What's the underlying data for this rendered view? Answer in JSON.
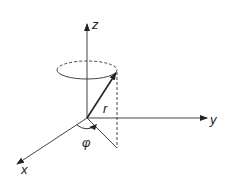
{
  "diagram": {
    "type": "3d-coordinate-system",
    "axes": {
      "x": {
        "label": "x"
      },
      "y": {
        "label": "y"
      },
      "z": {
        "label": "z"
      }
    },
    "vector": {
      "label": "r"
    },
    "angle": {
      "label": "φ"
    },
    "colors": {
      "stroke": "#333333",
      "background": "#ffffff"
    }
  }
}
